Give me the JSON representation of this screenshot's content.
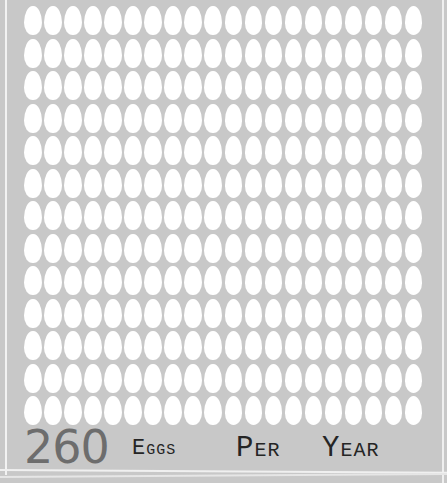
{
  "chart_data": {
    "type": "pictograph",
    "title": "260 EGGS PER YEAR",
    "value": 260,
    "unit_icon": "egg",
    "grid": {
      "rows": 13,
      "columns": 20
    },
    "total_icons": 260,
    "colors": {
      "background": "#c8c8c8",
      "icon": "#ffffff",
      "number": "#6d6d6d",
      "label": "#252525"
    }
  },
  "caption": {
    "number": "260",
    "word1": "Eggs",
    "word2": "Per",
    "word3": "Year"
  }
}
